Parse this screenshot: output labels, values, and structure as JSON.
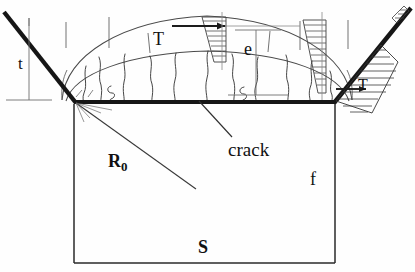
{
  "diagram": {
    "type": "engineering-cross-section",
    "colors": {
      "stroke_heavy": "#1a1a1a",
      "stroke_thin": "#555555",
      "stroke_hatch": "#444444",
      "background": "#fefefe",
      "text": "#111111"
    },
    "labels": {
      "thickness": "t",
      "temperature_top": "T",
      "embedment": "e",
      "temperature_right": "T",
      "crack": "crack",
      "radius": "R",
      "radius_subscript": "0",
      "face": "f",
      "slab": "S"
    },
    "label_roles": {
      "thickness": "left vertical dimension of inclined wall",
      "temperature_top": "gradient profile wedge at top centre",
      "embedment": "right vertical dimension between arcs and base",
      "temperature_right": "gradient profile wedge at right haunch",
      "crack": "leader line pointing to crack on the base line",
      "radius": "radius line from upper-left corner into the base",
      "face": "right inner face of the base rectangle",
      "slab": "base rectangle body"
    },
    "geometry": {
      "baseline": {
        "x1": 75,
        "y1": 102,
        "x2": 335,
        "y2": 102
      },
      "rectangle": {
        "x": 74,
        "y": 102,
        "width": 261,
        "height": 161
      },
      "left_wall": {
        "x1": 4,
        "y1": 12,
        "x2": 75,
        "y2": 102
      },
      "right_wall": {
        "x1": 335,
        "y1": 102,
        "x2": 411,
        "y2": 8
      },
      "outer_arc_peak_y": 16,
      "inner_arc_peak_y": 52,
      "radius_line": {
        "x1": 76,
        "y1": 103,
        "x2": 196,
        "y2": 189
      }
    }
  }
}
